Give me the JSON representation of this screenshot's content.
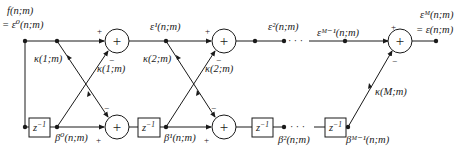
{
  "diagram": {
    "type": "lattice-filter-block-diagram",
    "input_label_line1": "f(n;m)",
    "input_label_line2": "= ε⁰(n;m)",
    "forward_labels": [
      "ε¹(n;m)",
      "ε²(n;m)",
      "εᴹ⁻¹(n;m)"
    ],
    "output_label_line1": "εᴹ(n;m)",
    "output_label_line2": "= ε(n;m)",
    "backward_labels": [
      "β⁰(n;m)",
      "β¹(n;m)",
      "β²(n;m)",
      "βᴹ⁻¹(n;m)"
    ],
    "coefficients": {
      "k1_top": "κ(1;m)",
      "k1_bottom": "κ(1;m)",
      "k2_top": "κ(2;m)",
      "k2_bottom": "κ(2;m)",
      "kM": "κ(M;m)"
    },
    "delay_label": "z",
    "delay_exp": "−1",
    "sum_symbol": "+",
    "plus_sign": "+",
    "minus_sign": "−",
    "ellipsis": "· · ·"
  }
}
